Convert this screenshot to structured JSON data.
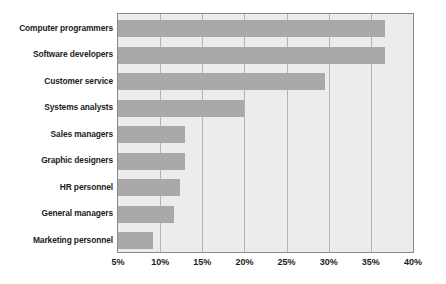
{
  "chart_data": {
    "type": "bar",
    "orientation": "horizontal",
    "title": "",
    "subtitle": "",
    "xlabel": "",
    "ylabel": "",
    "categories": [
      "Computer programmers",
      "Software developers",
      "Customer service",
      "Systems analysts",
      "Sales managers",
      "Graphic designers",
      "HR personnel",
      "General managers",
      "Marketing personnel"
    ],
    "values": [
      36.7,
      36.7,
      29.5,
      19.9,
      13.0,
      13.0,
      12.4,
      11.6,
      9.1
    ],
    "value_suffix": "%",
    "xlim": [
      5,
      40
    ],
    "xticks": [
      5,
      10,
      15,
      20,
      25,
      30,
      35,
      40
    ],
    "xtick_labels": [
      "5%",
      "10%",
      "15%",
      "20%",
      "25%",
      "30%",
      "35%",
      "40%"
    ],
    "grid": "vertical",
    "legend": "none",
    "series": [
      {
        "name": "Share",
        "values": [
          36.7,
          36.7,
          29.5,
          19.9,
          13.0,
          13.0,
          12.4,
          11.6,
          9.1
        ]
      }
    ]
  },
  "style": {
    "bar_color": "#a9a9a9",
    "plot_background": "#ececec",
    "gridline_color": "#b4b4b4",
    "border_color": "#8a8a8a",
    "text_color": "#1c1c1c",
    "page_background": "#ffffff"
  }
}
